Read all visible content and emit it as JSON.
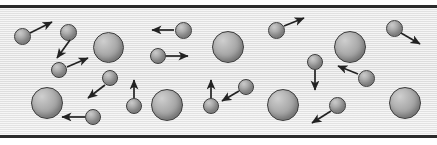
{
  "figure": {
    "width": 437,
    "height": 145,
    "background_color": "#ffffff"
  },
  "container": {
    "name": "gas-container",
    "wall_color": "#2b2b2b",
    "wall_thickness": 3,
    "top_wall_y": 5,
    "bottom_wall_y": 135,
    "interior_fill": "#e8e8e8",
    "interior_top": 8,
    "interior_height": 127,
    "texture": "horizontal-scanlines"
  },
  "legend": {
    "large_particle_label": "",
    "small_particle_label": "",
    "arrow_label": ""
  },
  "style": {
    "particle_outline": "#3a3a3a",
    "particle_fill_light": "#cfcfcf",
    "particle_fill_dark": "#888888",
    "arrow_color": "#222222"
  },
  "particles": [
    {
      "id": "p01",
      "size": "small",
      "cx": 22,
      "cy": 36,
      "r": 8.5
    },
    {
      "id": "p02",
      "size": "small",
      "cx": 68,
      "cy": 32,
      "r": 8.5
    },
    {
      "id": "p03",
      "size": "large",
      "cx": 108,
      "cy": 47,
      "r": 15.5
    },
    {
      "id": "p04",
      "size": "small",
      "cx": 59,
      "cy": 70,
      "r": 8.0
    },
    {
      "id": "p05",
      "size": "small",
      "cx": 110,
      "cy": 78,
      "r": 8.0
    },
    {
      "id": "p06",
      "size": "large",
      "cx": 47,
      "cy": 103,
      "r": 16.0
    },
    {
      "id": "p07",
      "size": "small",
      "cx": 93,
      "cy": 117,
      "r": 8.0
    },
    {
      "id": "p08",
      "size": "small",
      "cx": 183,
      "cy": 30,
      "r": 8.5
    },
    {
      "id": "p09",
      "size": "small",
      "cx": 158,
      "cy": 56,
      "r": 8.0
    },
    {
      "id": "p10",
      "size": "large",
      "cx": 228,
      "cy": 47,
      "r": 16.0
    },
    {
      "id": "p11",
      "size": "small",
      "cx": 134,
      "cy": 106,
      "r": 8.0
    },
    {
      "id": "p12",
      "size": "large",
      "cx": 167,
      "cy": 105,
      "r": 16.0
    },
    {
      "id": "p13",
      "size": "small",
      "cx": 276,
      "cy": 30,
      "r": 8.5
    },
    {
      "id": "p14",
      "size": "small",
      "cx": 315,
      "cy": 62,
      "r": 8.0
    },
    {
      "id": "p15",
      "size": "small",
      "cx": 211,
      "cy": 106,
      "r": 8.0
    },
    {
      "id": "p16",
      "size": "small",
      "cx": 246,
      "cy": 87,
      "r": 8.0
    },
    {
      "id": "p17",
      "size": "large",
      "cx": 283,
      "cy": 105,
      "r": 16.0
    },
    {
      "id": "p18",
      "size": "large",
      "cx": 350,
      "cy": 47,
      "r": 16.0
    },
    {
      "id": "p19",
      "size": "small",
      "cx": 394,
      "cy": 28,
      "r": 8.5
    },
    {
      "id": "p20",
      "size": "small",
      "cx": 366,
      "cy": 78,
      "r": 8.5
    },
    {
      "id": "p21",
      "size": "small",
      "cx": 337,
      "cy": 105,
      "r": 8.5
    },
    {
      "id": "p22",
      "size": "large",
      "cx": 405,
      "cy": 103,
      "r": 16.0
    }
  ],
  "velocity_arrows": [
    {
      "id": "a01",
      "from_particle": "p01",
      "x1": 30,
      "y1": 33,
      "x2": 52,
      "y2": 22,
      "direction": "up-right"
    },
    {
      "id": "a02",
      "from_particle": "p02",
      "x1": 70,
      "y1": 40,
      "x2": 57,
      "y2": 58,
      "direction": "down-left"
    },
    {
      "id": "a03",
      "from_particle": "p04",
      "x1": 67,
      "y1": 67,
      "x2": 88,
      "y2": 58,
      "direction": "up-right"
    },
    {
      "id": "a04",
      "from_particle": "p05",
      "x1": 105,
      "y1": 85,
      "x2": 88,
      "y2": 98,
      "direction": "down-left"
    },
    {
      "id": "a05",
      "from_particle": "p07",
      "x1": 85,
      "y1": 117,
      "x2": 62,
      "y2": 117,
      "direction": "left"
    },
    {
      "id": "a06",
      "from_particle": "p08",
      "x1": 174,
      "y1": 30,
      "x2": 152,
      "y2": 30,
      "direction": "left"
    },
    {
      "id": "a07",
      "from_particle": "p09",
      "x1": 166,
      "y1": 56,
      "x2": 188,
      "y2": 56,
      "direction": "right"
    },
    {
      "id": "a08",
      "from_particle": "p11",
      "x1": 134,
      "y1": 98,
      "x2": 134,
      "y2": 80,
      "direction": "up"
    },
    {
      "id": "a09",
      "from_particle": "p13",
      "x1": 284,
      "y1": 26,
      "x2": 304,
      "y2": 18,
      "direction": "up-right"
    },
    {
      "id": "a10",
      "from_particle": "p14",
      "x1": 315,
      "y1": 70,
      "x2": 315,
      "y2": 90,
      "direction": "down"
    },
    {
      "id": "a11",
      "from_particle": "p15",
      "x1": 211,
      "y1": 98,
      "x2": 211,
      "y2": 80,
      "direction": "up"
    },
    {
      "id": "a12",
      "from_particle": "p16",
      "x1": 239,
      "y1": 91,
      "x2": 222,
      "y2": 101,
      "direction": "down-left"
    },
    {
      "id": "a13",
      "from_particle": "p19",
      "x1": 401,
      "y1": 33,
      "x2": 420,
      "y2": 44,
      "direction": "down-right"
    },
    {
      "id": "a14",
      "from_particle": "p20",
      "x1": 358,
      "y1": 74,
      "x2": 338,
      "y2": 66,
      "direction": "up-left"
    },
    {
      "id": "a15",
      "from_particle": "p21",
      "x1": 331,
      "y1": 111,
      "x2": 312,
      "y2": 123,
      "direction": "down-left"
    }
  ]
}
